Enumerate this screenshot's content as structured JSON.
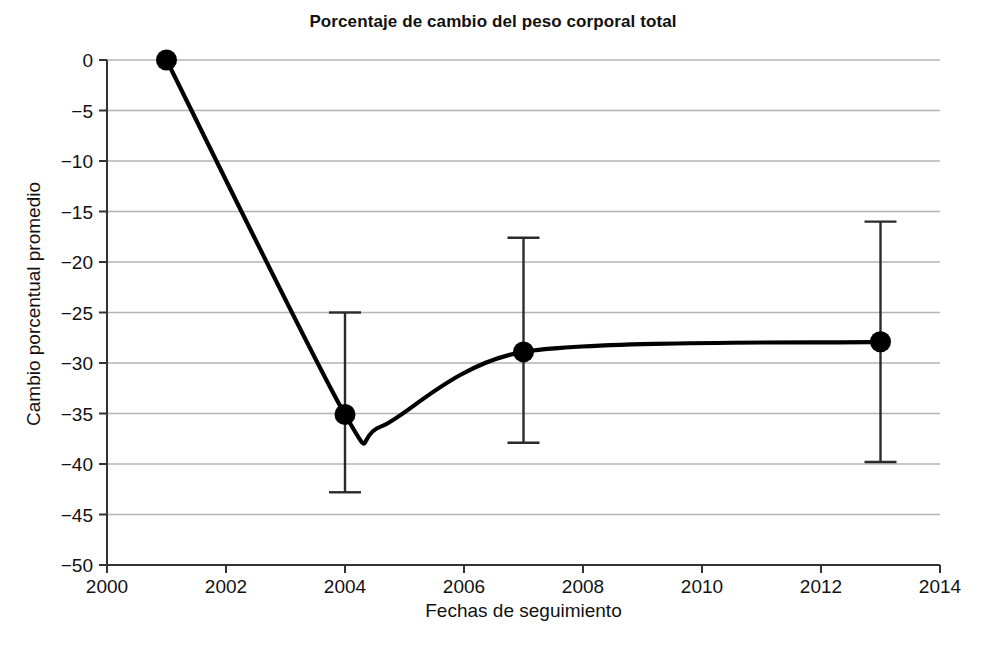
{
  "chart_data": {
    "type": "line",
    "title": "Porcentaje de cambio del peso corporal total",
    "xlabel": "Fechas de seguimiento",
    "ylabel": "Cambio porcentual promedio",
    "xlim": [
      2000,
      2014
    ],
    "ylim": [
      -50,
      0
    ],
    "grid": "horizontal",
    "legend": "none",
    "xticks": [
      "2000",
      "2002",
      "2004",
      "2006",
      "2008",
      "2010",
      "2012",
      "2014"
    ],
    "xtick_values": [
      2000,
      2002,
      2004,
      2006,
      2008,
      2010,
      2012,
      2014
    ],
    "yticks": [
      "0",
      "−5",
      "−10",
      "−15",
      "−20",
      "−25",
      "−30",
      "−35",
      "−40",
      "−45",
      "−50"
    ],
    "ytick_values": [
      0,
      -5,
      -10,
      -15,
      -20,
      -25,
      -30,
      -35,
      -40,
      -45,
      -50
    ],
    "x": [
      2001,
      2004,
      2007,
      2013
    ],
    "values": [
      0,
      -35.1,
      -28.9,
      -27.9
    ],
    "error_bars": [
      {
        "x": 2001,
        "upper": null,
        "lower": null
      },
      {
        "x": 2004,
        "upper": -25.0,
        "lower": -42.8
      },
      {
        "x": 2007,
        "upper": -17.6,
        "lower": -37.9
      },
      {
        "x": 2013,
        "upper": -16.0,
        "lower": -39.8
      }
    ],
    "curve_min": {
      "x": 2004.6,
      "y": -36.3
    },
    "marker": "filled-circle",
    "line_color": "#000000",
    "grid_color": "#b4b4b4"
  }
}
